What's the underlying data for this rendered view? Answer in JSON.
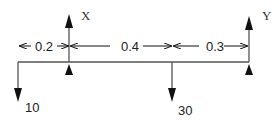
{
  "diagram": {
    "type": "beam-free-body",
    "supports": [
      {
        "name": "X",
        "x_px": 69
      },
      {
        "name": "Y",
        "x_px": 249
      }
    ],
    "loads": [
      {
        "value": "10",
        "x_px": 18,
        "direction": "down"
      },
      {
        "value": "30",
        "x_px": 172,
        "direction": "down"
      }
    ],
    "dimensions": [
      {
        "label": "0.2",
        "from": "left-end",
        "to": "X"
      },
      {
        "label": "0.4",
        "from": "X",
        "to": "load-30"
      },
      {
        "label": "0.3",
        "from": "load-30",
        "to": "Y"
      }
    ],
    "colors": {
      "line": "#555555",
      "arrow": "#111111",
      "text": "#222222"
    }
  }
}
